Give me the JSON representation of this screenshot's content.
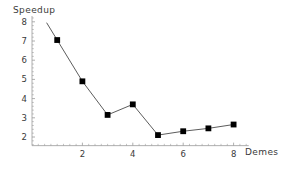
{
  "chart_data": {
    "type": "line",
    "title": "",
    "subtitle": "",
    "xlabel": "Demes",
    "ylabel": "Speedup",
    "x": [
      1,
      2,
      3,
      4,
      5,
      6,
      7,
      8
    ],
    "values": [
      7.05,
      4.9,
      3.15,
      3.7,
      2.1,
      2.3,
      2.45,
      2.65
    ],
    "series": [
      {
        "name": "Speedup",
        "marker": "filled-square",
        "line": true,
        "values": [
          7.05,
          4.9,
          3.15,
          3.7,
          2.1,
          2.3,
          2.45,
          2.65
        ]
      }
    ],
    "xlim": [
      0,
      8.6
    ],
    "ylim": [
      1.55,
      8.3
    ],
    "xticks": [
      2,
      4,
      6,
      8
    ],
    "xtick_labels": [
      "2",
      "4",
      "6",
      "8"
    ],
    "yticks": [
      2,
      3,
      4,
      5,
      6,
      7,
      8
    ],
    "ytick_labels": [
      "2",
      "3",
      "4",
      "5",
      "6",
      "7",
      "8"
    ],
    "grid": false,
    "legend": false,
    "legend_position": "none",
    "annotations": [],
    "colors": {
      "axis": "#9a9a9a",
      "line": "#4a4a4a",
      "marker": "#000000",
      "text": "#3a3a3a",
      "background": "#ffffff"
    }
  },
  "labels": {
    "y_axis_title": "Speedup",
    "x_axis_title": "Demes"
  }
}
